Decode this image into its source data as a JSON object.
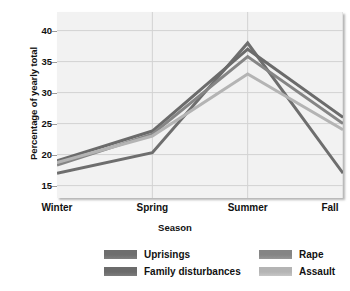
{
  "chart_data": {
    "type": "line",
    "title": "",
    "xlabel": "Season",
    "ylabel": "Percentage of yearly total",
    "categories": [
      "Winter",
      "Spring",
      "Summer",
      "Fall"
    ],
    "yticks": [
      15,
      20,
      25,
      30,
      35,
      40
    ],
    "ylim": [
      13,
      43
    ],
    "grid": true,
    "legend_position": "bottom",
    "series": [
      {
        "name": "Uprisings",
        "values": [
          17.0,
          20.3,
          38.0,
          17.0
        ],
        "color": "#6e6e6e"
      },
      {
        "name": "Family disturbances",
        "values": [
          19.0,
          23.8,
          37.0,
          26.0
        ],
        "color": "#6b6b6b"
      },
      {
        "name": "Rape",
        "values": [
          18.3,
          23.3,
          35.8,
          25.0
        ],
        "color": "#858585"
      },
      {
        "name": "Assault",
        "values": [
          18.7,
          23.0,
          33.0,
          24.0
        ],
        "color": "#b4b4b4"
      }
    ]
  },
  "plot": {
    "background_color": "#f2f2f2",
    "gridline_color": "#d2d2d2"
  }
}
